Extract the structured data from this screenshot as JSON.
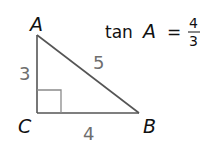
{
  "diagram": {
    "type": "right-triangle",
    "vertices": {
      "A": {
        "label": "A",
        "x": 37,
        "y": 35
      },
      "B": {
        "label": "B",
        "x": 139,
        "y": 113
      },
      "C": {
        "label": "C",
        "x": 37,
        "y": 113
      }
    },
    "sides": {
      "AC": {
        "label": "3"
      },
      "CB": {
        "label": "4"
      },
      "AB": {
        "label": "5"
      }
    },
    "right_angle_at": "C",
    "colors": {
      "line": "#555555",
      "side_label": "#6e6e6e",
      "vertex_label": "#111111"
    }
  },
  "equation": {
    "func": "tan",
    "var": "A",
    "equals": "=",
    "numerator": "4",
    "denominator": "3"
  }
}
